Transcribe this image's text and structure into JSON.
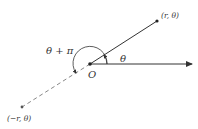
{
  "diagram": {
    "origin_label": "O",
    "point_label": "(r, θ)",
    "neg_point_label": "(−r, θ)",
    "angle_label": "θ",
    "angle_plus_pi_label": "θ + π",
    "colors": {
      "line": "#333333",
      "point": "#222222",
      "dashed": "#888888"
    }
  }
}
